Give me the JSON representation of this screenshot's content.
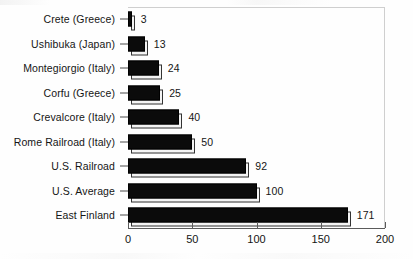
{
  "chart_data": {
    "type": "bar",
    "orientation": "horizontal",
    "title": "",
    "subtitle": "",
    "xlabel": "",
    "ylabel": "",
    "categories": [
      "Crete (Greece)",
      "Ushibuka (Japan)",
      "Montegiorgio (Italy)",
      "Corfu (Greece)",
      "Crevalcore (Italy)",
      "Rome Railroad (Italy)",
      "U.S. Railroad",
      "U.S. Average",
      "East Finland"
    ],
    "values": [
      3,
      13,
      24,
      25,
      40,
      50,
      92,
      100,
      171
    ],
    "value_labels": [
      "3",
      "13",
      "24",
      "25",
      "40",
      "50",
      "92",
      "100",
      "171"
    ],
    "xlim": [
      0,
      200
    ],
    "xticks": [
      0,
      50,
      100,
      150,
      200
    ],
    "xtick_labels": [
      "0",
      "50",
      "100",
      "150",
      "200"
    ],
    "grid": false,
    "legend": false,
    "legend_position": "none",
    "bar_color": "#0b0b0b",
    "bar_shadow_color": "#f4f4f4",
    "bar_outline_color": "#000000",
    "plot_border_color": "#cfcfcf",
    "axis_color": "#5a5a5a",
    "text_color": "#151515",
    "background_color": "#ffffff",
    "annotations": []
  }
}
